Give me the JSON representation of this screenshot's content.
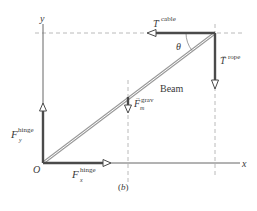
{
  "figure": {
    "caption": "(b)",
    "axes": {
      "x_label": "x",
      "y_label": "y",
      "origin_label": "O"
    },
    "beam_label": "Beam",
    "angle_label": "θ",
    "forces": {
      "t_cable": {
        "symbol": "T",
        "superscript": "cable"
      },
      "t_rope": {
        "symbol": "T",
        "superscript": "rope"
      },
      "f_grav": {
        "symbol": "F",
        "subscript": "m",
        "superscript": "grav"
      },
      "f_hinge_y": {
        "symbol": "F",
        "subscript": "y",
        "superscript": "hinge"
      },
      "f_hinge_x": {
        "symbol": "F",
        "subscript": "x",
        "superscript": "hinge"
      }
    },
    "colors": {
      "vector": "#4a4a4a",
      "axis": "#555555",
      "dashed": "#a0a0a0",
      "beam": "#9a9a9a",
      "text": "#3a3a3a"
    }
  }
}
